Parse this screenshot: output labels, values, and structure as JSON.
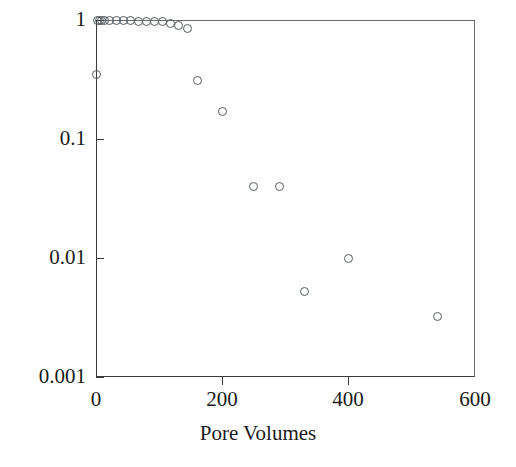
{
  "chart_data": {
    "type": "scatter",
    "title": "",
    "xlabel": "Pore Volumes",
    "ylabel": "",
    "xlim": [
      0,
      600
    ],
    "ylim": [
      0.001,
      1
    ],
    "yscale": "log",
    "xscale": "linear",
    "grid": false,
    "legend": null,
    "xticks": [
      0,
      200,
      400,
      600
    ],
    "xticklabels": [
      "0",
      "200",
      "400",
      "600"
    ],
    "yticks": [
      1,
      0.1,
      0.01,
      0.001
    ],
    "yticklabels": [
      "1",
      "0.1",
      "0.01",
      "0.001"
    ],
    "marker": "open-circle",
    "marker_color": "#555b60",
    "series": [
      {
        "name": "C/C0",
        "points": [
          {
            "x": 0,
            "y": 0.35
          },
          {
            "x": 2,
            "y": 1.0
          },
          {
            "x": 5,
            "y": 1.0
          },
          {
            "x": 9,
            "y": 1.0
          },
          {
            "x": 14,
            "y": 1.0
          },
          {
            "x": 22,
            "y": 0.99
          },
          {
            "x": 32,
            "y": 0.99
          },
          {
            "x": 43,
            "y": 0.99
          },
          {
            "x": 55,
            "y": 0.99
          },
          {
            "x": 68,
            "y": 0.98
          },
          {
            "x": 80,
            "y": 0.98
          },
          {
            "x": 92,
            "y": 0.97
          },
          {
            "x": 105,
            "y": 0.97
          },
          {
            "x": 118,
            "y": 0.93
          },
          {
            "x": 130,
            "y": 0.9
          },
          {
            "x": 145,
            "y": 0.85
          },
          {
            "x": 160,
            "y": 0.31
          },
          {
            "x": 200,
            "y": 0.17
          },
          {
            "x": 250,
            "y": 0.04
          },
          {
            "x": 290,
            "y": 0.04
          },
          {
            "x": 330,
            "y": 0.0052
          },
          {
            "x": 400,
            "y": 0.01
          },
          {
            "x": 540,
            "y": 0.0032
          }
        ]
      }
    ]
  },
  "axes": {
    "x_title": "Pore Volumes"
  }
}
